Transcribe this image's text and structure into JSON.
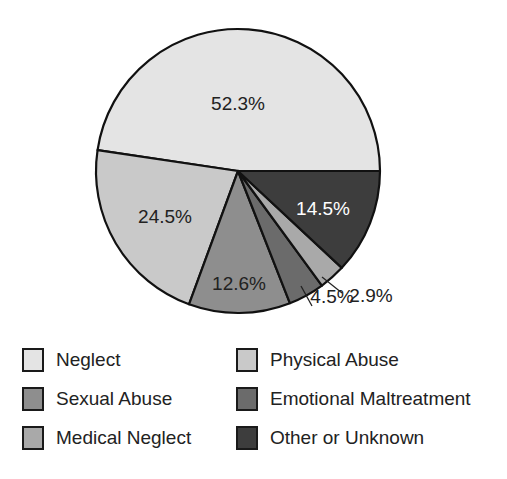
{
  "chart_data": {
    "type": "pie",
    "title": "",
    "slices": [
      {
        "label": "Neglect",
        "value": 52.3,
        "display": "52.3%",
        "color": "#e4e4e4"
      },
      {
        "label": "Physical Abuse",
        "value": 24.5,
        "display": "24.5%",
        "color": "#c9c9c9"
      },
      {
        "label": "Sexual Abuse",
        "value": 12.6,
        "display": "12.6%",
        "color": "#8e8e8e"
      },
      {
        "label": "Emotional Maltreatment",
        "value": 4.5,
        "display": "4.5%",
        "color": "#6b6b6b"
      },
      {
        "label": "Medical Neglect",
        "value": 2.9,
        "display": "2.9%",
        "color": "#a9a9a9"
      },
      {
        "label": "Other or Unknown",
        "value": 14.5,
        "display": "14.5%",
        "color": "#3d3d3d"
      }
    ],
    "legend_position": "bottom",
    "legend": [
      [
        "Neglect",
        "Physical Abuse"
      ],
      [
        "Sexual Abuse",
        "Emotional Maltreatment"
      ],
      [
        "Medical Neglect",
        "Other or Unknown"
      ]
    ]
  },
  "legend": {
    "items": [
      {
        "label": "Neglect",
        "color": "#e4e4e4"
      },
      {
        "label": "Physical Abuse",
        "color": "#c9c9c9"
      },
      {
        "label": "Sexual Abuse",
        "color": "#8e8e8e"
      },
      {
        "label": "Emotional Maltreatment",
        "color": "#6b6b6b"
      },
      {
        "label": "Medical Neglect",
        "color": "#a9a9a9"
      },
      {
        "label": "Other or Unknown",
        "color": "#3d3d3d"
      }
    ]
  }
}
